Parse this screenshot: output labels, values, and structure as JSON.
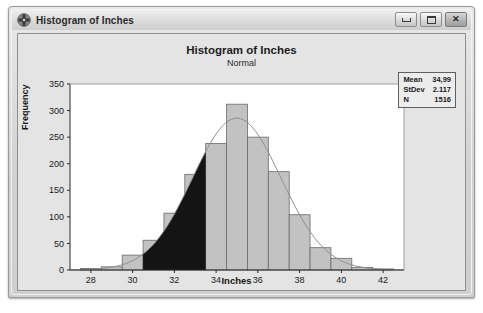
{
  "window": {
    "title": "Histogram of Inches",
    "icon": "minitab-graph-icon",
    "controls": [
      {
        "name": "minimize",
        "label": "—"
      },
      {
        "name": "maximize",
        "label": "□"
      },
      {
        "name": "close",
        "label": "✕"
      }
    ]
  },
  "stats": {
    "rows": [
      {
        "label": "Mean",
        "value": "34,99"
      },
      {
        "label": "StDev",
        "value": "2.117"
      },
      {
        "label": "N",
        "value": "1516"
      }
    ]
  },
  "chart_data": {
    "type": "bar",
    "title": "Histogram of Inches",
    "subtitle": "Normal",
    "xlabel": "Inches",
    "ylabel": "Frequency",
    "xlim": [
      27.0,
      43.0
    ],
    "ylim": [
      0,
      350
    ],
    "xticks": [
      28,
      30,
      32,
      34,
      36,
      38,
      40,
      42
    ],
    "yticks": [
      0,
      50,
      100,
      150,
      200,
      250,
      300,
      350
    ],
    "grid": false,
    "legend": null,
    "bin_width": 1,
    "bin_centers": [
      28,
      29,
      30,
      31,
      32,
      33,
      34,
      35,
      36,
      37,
      38,
      39,
      40,
      41,
      42
    ],
    "categories": [
      "28",
      "29",
      "30",
      "31",
      "32",
      "33",
      "34",
      "35",
      "36",
      "37",
      "38",
      "39",
      "40",
      "41",
      "42"
    ],
    "values": [
      3,
      6,
      28,
      56,
      107,
      180,
      238,
      312,
      250,
      185,
      104,
      42,
      22,
      5,
      2
    ],
    "bar_fill": "#c2c2c2",
    "bar_edge": "#6a6a6a",
    "shaded_fill": "#141414",
    "shaded_region": {
      "from": 30.5,
      "to": 33.5,
      "label": "lower tail area under normal curve"
    },
    "normal_curve": {
      "mean": 34.99,
      "stdev": 2.117,
      "n": 1516,
      "color": "#8e8e8e"
    },
    "annotations": [
      {
        "text": "Mean  34,99"
      },
      {
        "text": "StDev  2.117"
      },
      {
        "text": "N  1516"
      }
    ]
  }
}
